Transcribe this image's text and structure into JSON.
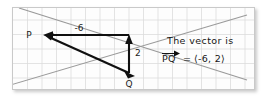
{
  "figure": {
    "title_absent": true,
    "points": [
      {
        "name": "point-p",
        "label": "P",
        "x": 42,
        "y": 34,
        "label_x": 30,
        "label_y": 37
      },
      {
        "name": "point-q",
        "label": "Q",
        "x": 128,
        "y": 72,
        "label_x": 125,
        "label_y": 85
      }
    ],
    "component_labels": [
      {
        "name": "horizontal-component-label",
        "label": "-6",
        "x": 78,
        "y": 31
      },
      {
        "name": "vertical-component-label",
        "label": "2",
        "x": 132,
        "y": 52
      }
    ],
    "annotation": {
      "line1": "The vector is",
      "line2_vector_name": "PQ",
      "line2_equals": "=",
      "line2_value": "⟨-6, 2⟩",
      "line1_x": 166,
      "line1_y": 43,
      "line2_x": 161,
      "line2_y": 61
    },
    "vectors": [
      {
        "name": "vector-horizontal",
        "from_x": 128,
        "from_y": 34,
        "to_x": 44,
        "to_y": 34,
        "value": -6
      },
      {
        "name": "vector-vertical",
        "from_x": 128,
        "from_y": 72,
        "to_x": 128,
        "to_y": 35,
        "value": 2
      },
      {
        "name": "vector-pq",
        "from_x": 128,
        "from_y": 72,
        "to_x": 44,
        "to_y": 35,
        "value": "(-6, 2)"
      }
    ],
    "diagonals": [
      {
        "name": "diagonal-descending",
        "x1": 18,
        "y1": 6,
        "x2": 245,
        "y2": 78
      },
      {
        "name": "diagonal-ascending",
        "x1": 6,
        "y1": 84,
        "x2": 245,
        "y2": 14
      }
    ],
    "grid": {
      "cell_size": 14.5,
      "color": "#dcdcdc",
      "visible": true
    },
    "colors": {
      "background": "#ffffff",
      "panel": "#fdfdfd",
      "frame_border": "#c9c9c9",
      "grid": "#dcdcdc",
      "diagonal": "#9a9a9a",
      "vector": "#101010",
      "text": "#151515"
    }
  }
}
